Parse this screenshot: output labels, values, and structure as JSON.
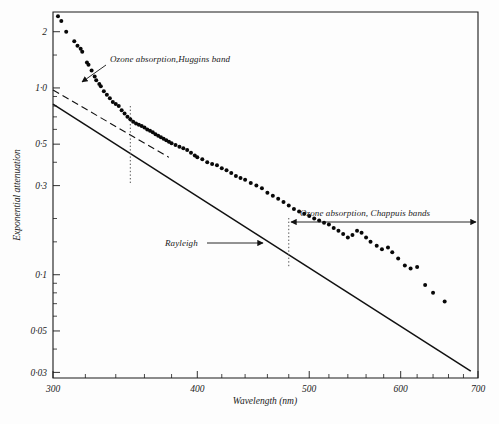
{
  "figure": {
    "background_color": "#fdfdfd",
    "ink_color": "#111111"
  },
  "chart_data": {
    "type": "scatter",
    "title": "",
    "xlabel": "Wavelength (nm)",
    "ylabel": "Exponential attenuation",
    "xscale": "log",
    "yscale": "log",
    "xlim": [
      300,
      700
    ],
    "ylim": [
      0.028,
      2.55
    ],
    "grid": false,
    "legend": "none",
    "xticks_major": [
      300,
      400,
      500,
      600,
      700
    ],
    "xtick_labels": [
      "300",
      "400",
      "500",
      "600",
      "700"
    ],
    "xticks_minor": [
      320,
      340,
      360,
      380,
      420,
      440,
      460,
      480,
      520,
      540,
      560,
      580,
      620,
      640,
      660,
      680
    ],
    "yticks_major": [
      2,
      1.0,
      0.5,
      0.3,
      0.1,
      0.05,
      0.03
    ],
    "ytick_labels": [
      "2",
      "1·0",
      "0·5",
      "0·3",
      "0·1",
      "0·05",
      "0·03"
    ],
    "yticks_minor": [
      1.5,
      0.9,
      0.8,
      0.7,
      0.6,
      0.4,
      0.2,
      0.15,
      0.09,
      0.08,
      0.07,
      0.06,
      0.04
    ],
    "series": [
      {
        "name": "Measured attenuation",
        "marker": "filled-circle",
        "points": [
          [
            303,
            2.42
          ],
          [
            305,
            2.28
          ],
          [
            308,
            2.0
          ],
          [
            313,
            1.78
          ],
          [
            315,
            1.68
          ],
          [
            317,
            1.62
          ],
          [
            318,
            1.56
          ],
          [
            321,
            1.37
          ],
          [
            322,
            1.33
          ],
          [
            324,
            1.24
          ],
          [
            326,
            1.15
          ],
          [
            327,
            1.1
          ],
          [
            329,
            1.05
          ],
          [
            330,
            1.02
          ],
          [
            332,
            0.96
          ],
          [
            334,
            0.92
          ],
          [
            336,
            0.88
          ],
          [
            338,
            0.84
          ],
          [
            340,
            0.82
          ],
          [
            342,
            0.8
          ],
          [
            344,
            0.76
          ],
          [
            346,
            0.73
          ],
          [
            348,
            0.7
          ],
          [
            350,
            0.68
          ],
          [
            352,
            0.66
          ],
          [
            354,
            0.645
          ],
          [
            356,
            0.635
          ],
          [
            358,
            0.625
          ],
          [
            360,
            0.615
          ],
          [
            362,
            0.6
          ],
          [
            364,
            0.59
          ],
          [
            366,
            0.58
          ],
          [
            368,
            0.565
          ],
          [
            370,
            0.555
          ],
          [
            372,
            0.545
          ],
          [
            374,
            0.535
          ],
          [
            376,
            0.525
          ],
          [
            378,
            0.515
          ],
          [
            380,
            0.505
          ],
          [
            383,
            0.495
          ],
          [
            386,
            0.485
          ],
          [
            389,
            0.475
          ],
          [
            392,
            0.465
          ],
          [
            395,
            0.45
          ],
          [
            398,
            0.435
          ],
          [
            400,
            0.425
          ],
          [
            404,
            0.415
          ],
          [
            408,
            0.4
          ],
          [
            412,
            0.392
          ],
          [
            416,
            0.385
          ],
          [
            420,
            0.372
          ],
          [
            424,
            0.362
          ],
          [
            428,
            0.35
          ],
          [
            432,
            0.338
          ],
          [
            436,
            0.33
          ],
          [
            440,
            0.322
          ],
          [
            445,
            0.31
          ],
          [
            450,
            0.3
          ],
          [
            455,
            0.29
          ],
          [
            460,
            0.275
          ],
          [
            465,
            0.265
          ],
          [
            470,
            0.255
          ],
          [
            475,
            0.245
          ],
          [
            480,
            0.235
          ],
          [
            485,
            0.225
          ],
          [
            490,
            0.218
          ],
          [
            495,
            0.212
          ],
          [
            500,
            0.206
          ],
          [
            505,
            0.2
          ],
          [
            510,
            0.195
          ],
          [
            515,
            0.19
          ],
          [
            520,
            0.186
          ],
          [
            525,
            0.178
          ],
          [
            530,
            0.172
          ],
          [
            535,
            0.165
          ],
          [
            540,
            0.158
          ],
          [
            545,
            0.163
          ],
          [
            550,
            0.172
          ],
          [
            555,
            0.168
          ],
          [
            560,
            0.158
          ],
          [
            565,
            0.15
          ],
          [
            572,
            0.143
          ],
          [
            578,
            0.137
          ],
          [
            585,
            0.14
          ],
          [
            590,
            0.132
          ],
          [
            597,
            0.122
          ],
          [
            605,
            0.112
          ],
          [
            612,
            0.108
          ],
          [
            620,
            0.11
          ],
          [
            630,
            0.088
          ],
          [
            640,
            0.08
          ],
          [
            655,
            0.072
          ]
        ]
      }
    ],
    "reference_lines": [
      {
        "name": "Rayleigh",
        "style": "solid",
        "label": "Rayleigh",
        "x": [
          300,
          690
        ],
        "y": [
          0.82,
          0.0305
        ]
      },
      {
        "name": "extrapolated-rayleigh",
        "style": "dashed",
        "label": "",
        "x": [
          300,
          378
        ],
        "y": [
          0.975,
          0.425
        ]
      }
    ],
    "annotations": [
      {
        "name": "huggins-band",
        "text": "Ozone absorption,Huggins band",
        "arrow_to_x": 322,
        "arrow_to_y": 1.3
      },
      {
        "name": "chappuis-bands",
        "text": "Ozone absorption, Chappuis bands",
        "range_start_x": 480,
        "range_end_x": 700
      },
      {
        "name": "rayleigh-label",
        "text": "Rayleigh",
        "arrow_to_x": 462,
        "arrow_to_y": 0.183
      }
    ],
    "marker_lines": [
      {
        "name": "huggins-boundary",
        "x": 350,
        "style": "dotted"
      },
      {
        "name": "chappuis-boundary",
        "x": 480,
        "style": "dotted"
      }
    ]
  }
}
